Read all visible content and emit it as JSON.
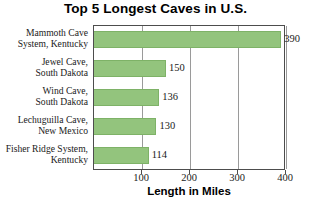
{
  "chart_data": {
    "type": "bar",
    "orientation": "horizontal",
    "title": "Top 5 Longest Caves in U.S.",
    "xlabel": "Length in Miles",
    "ylabel": "",
    "xlim": [
      0,
      400
    ],
    "xticks": [
      100,
      200,
      300,
      400
    ],
    "grid": "vertical",
    "legend": "none",
    "bar_color": "#93c47d",
    "categories": [
      "Mammoth Cave System, Kentucky",
      "Jewel Cave, South Dakota",
      "Wind Cave, South Dakota",
      "Lechuguilla Cave, New Mexico",
      "Fisher Ridge System, Kentucky"
    ],
    "values": [
      390,
      150,
      136,
      130,
      114
    ],
    "bars": [
      {
        "label_line1": "Mammoth Cave",
        "label_line2": "System, Kentucky",
        "value": 390,
        "value_label": "390"
      },
      {
        "label_line1": "Jewel Cave,",
        "label_line2": "South Dakota",
        "value": 150,
        "value_label": "150"
      },
      {
        "label_line1": "Wind Cave,",
        "label_line2": "South Dakota",
        "value": 136,
        "value_label": "136"
      },
      {
        "label_line1": "Lechuguilla Cave,",
        "label_line2": "New Mexico",
        "value": 130,
        "value_label": "130"
      },
      {
        "label_line1": "Fisher Ridge System,",
        "label_line2": "Kentucky",
        "value": 114,
        "value_label": "114"
      }
    ],
    "xtick_labels": [
      "100",
      "200",
      "300",
      "400"
    ]
  }
}
